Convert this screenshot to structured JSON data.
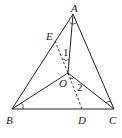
{
  "diagram": {
    "type": "geometry",
    "points": {
      "A": {
        "label": "A",
        "x": 73,
        "y": 14
      },
      "B": {
        "label": "B",
        "x": 12,
        "y": 109
      },
      "C": {
        "label": "C",
        "x": 114,
        "y": 109
      },
      "O": {
        "label": "O",
        "x": 68,
        "y": 73
      },
      "E": {
        "label": "E",
        "x": 55,
        "y": 41
      },
      "D": {
        "label": "D",
        "x": 82,
        "y": 109
      }
    },
    "angle_labels": {
      "angle1": "1",
      "angle2": "2"
    },
    "segments_solid": [
      "AB",
      "AC",
      "BC",
      "AO",
      "BO",
      "CO"
    ],
    "segments_dashed": [
      "EO",
      "OD"
    ],
    "colors": {
      "stroke": "#222222",
      "background": "#ffffff"
    }
  }
}
